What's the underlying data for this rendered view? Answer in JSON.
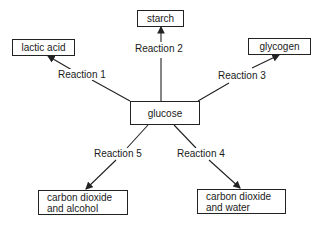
{
  "diagram": {
    "center": {
      "label": "glucose"
    },
    "products": [
      {
        "id": "lactic-acid",
        "lines": [
          "lactic acid"
        ],
        "reaction": "Reaction 1"
      },
      {
        "id": "starch",
        "lines": [
          "starch"
        ],
        "reaction": "Reaction 2"
      },
      {
        "id": "glycogen",
        "lines": [
          "glycogen"
        ],
        "reaction": "Reaction 3"
      },
      {
        "id": "co2-water",
        "lines": [
          "carbon dioxide",
          "and water"
        ],
        "reaction": "Reaction 4"
      },
      {
        "id": "co2-alcohol",
        "lines": [
          "carbon dioxide",
          "and alcohol"
        ],
        "reaction": "Reaction 5"
      }
    ],
    "colors": {
      "line": "#222222",
      "background": "#ffffff"
    }
  }
}
